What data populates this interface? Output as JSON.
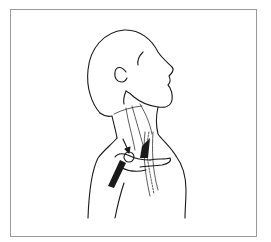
{
  "figure": {
    "colors": {
      "line": "#1a1a1a",
      "frame": "#9a9a9a",
      "background": "#ffffff"
    },
    "elements": [
      "head-outline",
      "ear",
      "neck-vessels",
      "clavicle",
      "vessel-band",
      "arrow",
      "circle-marker",
      "dotted-vessel"
    ]
  }
}
